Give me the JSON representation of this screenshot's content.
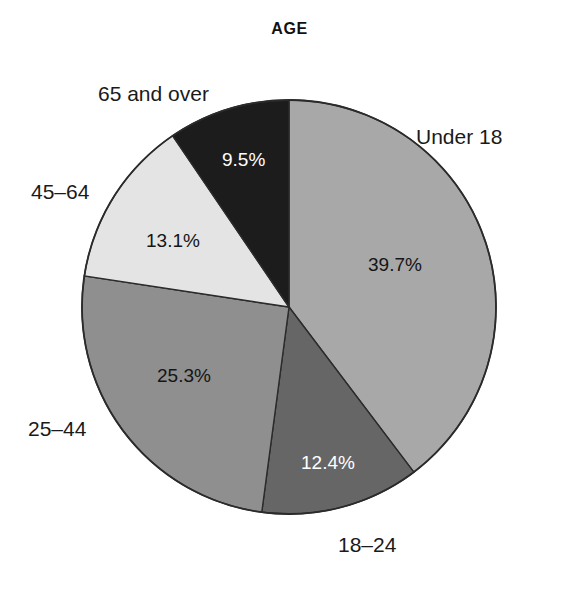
{
  "chart_data": {
    "type": "pie",
    "title": "AGE",
    "xlabel": "",
    "ylabel": "",
    "legend_position": "none",
    "grid": false,
    "value_unit": "percent",
    "start_angle_deg": 0,
    "direction": "clockwise",
    "categories": [
      "Under 18",
      "18–24",
      "25–44",
      "45–64",
      "65 and over"
    ],
    "values": [
      39.7,
      12.4,
      25.3,
      13.1,
      9.5
    ],
    "value_labels": [
      "39.7%",
      "12.4%",
      "25.3%",
      "13.1%",
      "9.5%"
    ],
    "colors": [
      "#a8a8a8",
      "#666666",
      "#8f8f8f",
      "#e4e4e4",
      "#1c1c1c"
    ],
    "label_text_colors": [
      "#151515",
      "#ffffff",
      "#151515",
      "#151515",
      "#ffffff"
    ],
    "slices": [
      {
        "name": "Under 18",
        "value": 39.7,
        "value_label": "39.7%",
        "color": "#a8a8a8",
        "label_color": "#151515"
      },
      {
        "name": "18–24",
        "value": 12.4,
        "value_label": "12.4%",
        "color": "#666666",
        "label_color": "#ffffff"
      },
      {
        "name": "25–44",
        "value": 25.3,
        "value_label": "25.3%",
        "color": "#8f8f8f",
        "label_color": "#151515"
      },
      {
        "name": "45–64",
        "value": 13.1,
        "value_label": "13.1%",
        "color": "#e4e4e4",
        "label_color": "#151515"
      },
      {
        "name": "65 and over",
        "value": 9.5,
        "value_label": "9.5%",
        "color": "#1c1c1c",
        "label_color": "#ffffff"
      }
    ]
  },
  "chart": {
    "title": "AGE"
  },
  "labels": {
    "under_18": "Under 18",
    "age_18_24": "18–24",
    "age_25_44": "25–44",
    "age_45_64": "45–64",
    "age_65_over": "65 and over"
  },
  "percentages": {
    "under_18": "39.7%",
    "age_18_24": "12.4%",
    "age_25_44": "25.3%",
    "age_45_64": "13.1%",
    "age_65_over": "9.5%"
  }
}
